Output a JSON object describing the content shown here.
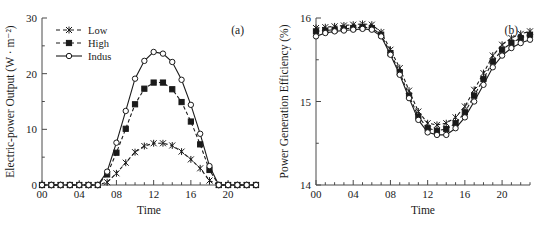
{
  "figure": {
    "panels": [
      {
        "tag": "(a)",
        "xlabel": "Time",
        "ylabel": "Electric-power Output (W · m⁻²)",
        "x_ticks": [
          "00",
          "04",
          "08",
          "12",
          "16",
          "20"
        ],
        "y_ticks": [
          "0",
          "10",
          "20",
          "30"
        ],
        "legend": [
          {
            "label": "Low",
            "marker": "star",
            "line": "dashed"
          },
          {
            "label": "High",
            "marker": "square",
            "line": "dashed"
          },
          {
            "label": "Indus",
            "marker": "circle",
            "line": "solid"
          }
        ]
      },
      {
        "tag": "(b)",
        "xlabel": "Time",
        "ylabel": "Power Generation Efficiency (%)",
        "x_ticks": [
          "00",
          "04",
          "08",
          "12",
          "16",
          "20"
        ],
        "y_ticks": [
          "14",
          "15",
          "16"
        ],
        "legend": []
      }
    ]
  },
  "chart_data": [
    {
      "type": "line",
      "title": "(a)",
      "xlabel": "Time",
      "ylabel": "Electric-power Output (W · m⁻²)",
      "x": [
        0,
        1,
        2,
        3,
        4,
        5,
        6,
        7,
        8,
        9,
        10,
        11,
        12,
        13,
        14,
        15,
        16,
        17,
        18,
        19,
        20,
        21,
        22,
        23
      ],
      "x_tick_values": [
        0,
        4,
        8,
        12,
        16,
        20
      ],
      "x_tick_labels": [
        "00",
        "04",
        "08",
        "12",
        "16",
        "20"
      ],
      "xlim": [
        0,
        23
      ],
      "ylim": [
        0,
        30
      ],
      "y_tick_values": [
        0,
        10,
        20,
        30
      ],
      "y_tick_labels": [
        "0",
        "10",
        "20",
        "30"
      ],
      "grid": false,
      "legend_position": "top-left",
      "series": [
        {
          "name": "Low",
          "marker": "star",
          "line": "dashed",
          "values": [
            0,
            0,
            0,
            0,
            0,
            0,
            0,
            0.5,
            2.1,
            4.0,
            5.9,
            7.0,
            7.5,
            7.5,
            7.1,
            6.0,
            4.6,
            3.0,
            0.8,
            0,
            0,
            0,
            0,
            0
          ]
        },
        {
          "name": "High",
          "marker": "square",
          "line": "dashed",
          "values": [
            0,
            0,
            0,
            0,
            0,
            0,
            0,
            1.9,
            5.8,
            10.1,
            14.5,
            17.3,
            18.4,
            18.4,
            17.2,
            14.9,
            11.4,
            7.3,
            2.7,
            0,
            0,
            0,
            0,
            0
          ]
        },
        {
          "name": "Indus",
          "marker": "circle",
          "line": "solid",
          "values": [
            0,
            0,
            0,
            0,
            0,
            0,
            0,
            2.4,
            7.6,
            13.3,
            19.1,
            22.3,
            23.9,
            23.6,
            22.1,
            18.9,
            14.4,
            9.2,
            3.4,
            0,
            0,
            0,
            0,
            0
          ]
        }
      ]
    },
    {
      "type": "line",
      "title": "(b)",
      "xlabel": "Time",
      "ylabel": "Power Generation Efficiency (%)",
      "x": [
        0,
        1,
        2,
        3,
        4,
        5,
        6,
        7,
        8,
        9,
        10,
        11,
        12,
        13,
        14,
        15,
        16,
        17,
        18,
        19,
        20,
        21,
        22,
        23
      ],
      "x_tick_values": [
        0,
        4,
        8,
        12,
        16,
        20
      ],
      "x_tick_labels": [
        "00",
        "04",
        "08",
        "12",
        "16",
        "20"
      ],
      "xlim": [
        0,
        23
      ],
      "ylim": [
        14,
        16
      ],
      "y_tick_values": [
        14,
        15,
        16
      ],
      "y_tick_labels": [
        "14",
        "15",
        "16"
      ],
      "grid": false,
      "legend_position": "none",
      "series": [
        {
          "name": "Low",
          "marker": "star",
          "line": "dashed",
          "values": [
            15.88,
            15.89,
            15.9,
            15.91,
            15.92,
            15.93,
            15.92,
            15.83,
            15.62,
            15.4,
            15.13,
            14.88,
            14.74,
            14.72,
            14.74,
            14.81,
            14.94,
            15.14,
            15.34,
            15.55,
            15.68,
            15.76,
            15.81,
            15.84
          ]
        },
        {
          "name": "High",
          "marker": "square",
          "line": "dashed",
          "values": [
            15.84,
            15.85,
            15.86,
            15.87,
            15.88,
            15.89,
            15.88,
            15.8,
            15.58,
            15.35,
            15.07,
            14.82,
            14.68,
            14.65,
            14.67,
            14.74,
            14.87,
            15.07,
            15.27,
            15.48,
            15.62,
            15.7,
            15.76,
            15.8
          ]
        },
        {
          "name": "Indus",
          "marker": "circle",
          "line": "solid",
          "values": [
            15.78,
            15.82,
            15.84,
            15.85,
            15.86,
            15.87,
            15.86,
            15.78,
            15.56,
            15.32,
            15.04,
            14.78,
            14.63,
            14.6,
            14.6,
            14.68,
            14.81,
            15.0,
            15.2,
            15.41,
            15.55,
            15.64,
            15.7,
            15.74
          ]
        }
      ]
    }
  ]
}
